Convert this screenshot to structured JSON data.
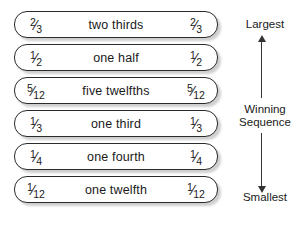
{
  "diagram": {
    "background_color": "#ffffff",
    "line_color": "#2b2b2b",
    "shadow_color": "#bfbfbf",
    "rows": [
      {
        "left_fraction": {
          "numerator": "2",
          "slash": "⁄",
          "denominator": "3"
        },
        "name": "two thirds",
        "right_fraction": {
          "numerator": "2",
          "slash": "⁄",
          "denominator": "3"
        }
      },
      {
        "left_fraction": {
          "numerator": "1",
          "slash": "⁄",
          "denominator": "2"
        },
        "name": "one half",
        "right_fraction": {
          "numerator": "1",
          "slash": "⁄",
          "denominator": "2"
        }
      },
      {
        "left_fraction": {
          "numerator": "5",
          "slash": "⁄",
          "denominator": "12"
        },
        "name": "five twelfths",
        "right_fraction": {
          "numerator": "5",
          "slash": "⁄",
          "denominator": "12"
        }
      },
      {
        "left_fraction": {
          "numerator": "1",
          "slash": "⁄",
          "denominator": "3"
        },
        "name": "one third",
        "right_fraction": {
          "numerator": "1",
          "slash": "⁄",
          "denominator": "3"
        }
      },
      {
        "left_fraction": {
          "numerator": "1",
          "slash": "⁄",
          "denominator": "4"
        },
        "name": "one fourth",
        "right_fraction": {
          "numerator": "1",
          "slash": "⁄",
          "denominator": "4"
        }
      },
      {
        "left_fraction": {
          "numerator": "1",
          "slash": "⁄",
          "denominator": "12"
        },
        "name": "one twelfth",
        "right_fraction": {
          "numerator": "1",
          "slash": "⁄",
          "denominator": "12"
        }
      }
    ],
    "axis": {
      "top_label": "Largest",
      "middle_label_line1": "Winning",
      "middle_label_line2": "Sequence",
      "bottom_label": "Smallest"
    }
  }
}
